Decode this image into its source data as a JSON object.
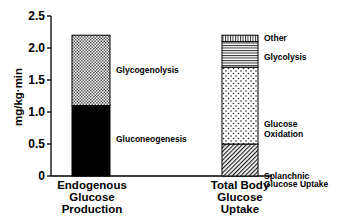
{
  "chart_data": {
    "type": "bar",
    "subtype": "stacked",
    "title": "",
    "xlabel": "",
    "ylabel": "mg/kg·min",
    "ylim": [
      0,
      2.5
    ],
    "yticks": [
      0,
      0.5,
      1.0,
      1.5,
      2.0,
      2.5
    ],
    "ytick_labels": [
      "0",
      "0.5",
      "1.0",
      "1.5",
      "2.0",
      "2.5"
    ],
    "grid": false,
    "legend": "none (segments labeled inline, right of bars)",
    "categories": [
      [
        "Endogenous",
        "Glucose",
        "Production"
      ],
      [
        "Total Body",
        "Glucose",
        "Uptake"
      ]
    ],
    "bars": [
      {
        "category": "Endogenous Glucose Production",
        "total": 2.2,
        "segments": [
          {
            "name": "Gluconeogenesis",
            "value": 1.1,
            "pattern": "solid-black",
            "label_lines": [
              "Gluconeogenesis"
            ]
          },
          {
            "name": "Glycogenolysis",
            "value": 1.1,
            "pattern": "crosshatch",
            "label_lines": [
              "Glycogenolysis"
            ]
          }
        ]
      },
      {
        "category": "Total Body Glucose Uptake",
        "total": 2.2,
        "segments": [
          {
            "name": "Splanchnic Glucose Uptake",
            "value": 0.5,
            "pattern": "diagonal-hatch",
            "label_lines": [
              "Splanchnic",
              "Glucose Uptake"
            ]
          },
          {
            "name": "Glucose Oxidation",
            "value": 1.2,
            "pattern": "dots",
            "label_lines": [
              "Glucose",
              "Oxidation"
            ]
          },
          {
            "name": "Glycolysis",
            "value": 0.4,
            "pattern": "horizontal-lines",
            "label_lines": [
              "Glycolysis"
            ]
          },
          {
            "name": "Other",
            "value": 0.1,
            "pattern": "vertical-lines",
            "label_lines": [
              "Other"
            ]
          }
        ]
      }
    ]
  }
}
